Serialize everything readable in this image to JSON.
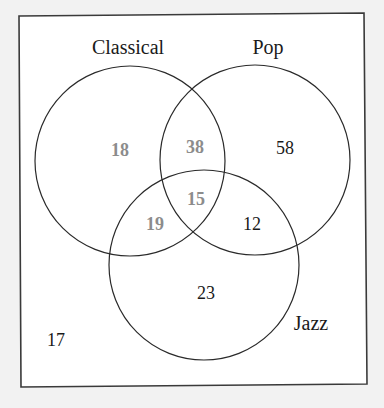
{
  "diagram": {
    "type": "venn",
    "sets": [
      {
        "name": "Classical",
        "label": "Classical"
      },
      {
        "name": "Pop",
        "label": "Pop"
      },
      {
        "name": "Jazz",
        "label": "Jazz"
      }
    ],
    "labels": {
      "classical": "Classical",
      "pop": "Pop",
      "jazz": "Jazz"
    },
    "regions": {
      "classical_only": "18",
      "classical_pop_only": "38",
      "pop_only": "58",
      "all_three": "15",
      "classical_jazz_only": "19",
      "pop_jazz_only": "12",
      "jazz_only": "23",
      "none": "17"
    },
    "colors": {
      "highlighted_region_text": "#8c8c8c",
      "normal_region_text": "#1a1a1a",
      "outline": "#2a2a2a",
      "page_background": "#f2f2f2",
      "box_background": "#ffffff"
    }
  }
}
